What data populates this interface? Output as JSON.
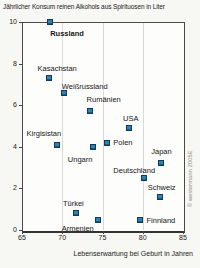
{
  "chart_data": {
    "type": "scatter",
    "title": "Jährlicher Konsum reinen Alkohols aus Spirituosen in Liter",
    "xlabel": "Lebenserwartung bei Geburt in Jahren",
    "ylabel": "",
    "xlim": [
      65,
      85
    ],
    "ylim": [
      0,
      10
    ],
    "x_ticks": [
      65,
      70,
      75,
      80,
      85
    ],
    "y_ticks": [
      0,
      2,
      4,
      6,
      8,
      10
    ],
    "x_gridlines": [
      70,
      75,
      80
    ],
    "grid": "vertical-only",
    "legend": "none",
    "marker": {
      "shape": "square",
      "fill": "#2b84b4",
      "border": "#123a57",
      "size": 6
    },
    "source": "© westermann 2005E",
    "points": [
      {
        "name": "Russland",
        "x": 68.5,
        "y": 10.0,
        "bold": true,
        "label_dx": 0,
        "label_dy": 8
      },
      {
        "name": "Kasachstan",
        "x": 68.3,
        "y": 7.3,
        "bold": false,
        "label_dx": -11,
        "label_dy": -13
      },
      {
        "name": "Weißrussland",
        "x": 70.2,
        "y": 6.6,
        "bold": false,
        "label_dx": -2,
        "label_dy": -10
      },
      {
        "name": "Rumänien",
        "x": 73.4,
        "y": 5.7,
        "bold": false,
        "label_dx": -3,
        "label_dy": -15
      },
      {
        "name": "USA",
        "x": 78.3,
        "y": 4.9,
        "bold": false,
        "label_dx": -6,
        "label_dy": -13
      },
      {
        "name": "Polen",
        "x": 75.6,
        "y": 4.2,
        "bold": false,
        "label_dx": 6,
        "label_dy": -4
      },
      {
        "name": "Kirgisistan",
        "x": 69.3,
        "y": 4.1,
        "bold": false,
        "label_dx": -30,
        "label_dy": -15
      },
      {
        "name": "Ungarn",
        "x": 73.8,
        "y": 4.0,
        "bold": false,
        "label_dx": -25,
        "label_dy": 9
      },
      {
        "name": "Japan",
        "x": 82.3,
        "y": 3.2,
        "bold": false,
        "label_dx": -10,
        "label_dy": -15
      },
      {
        "name": "Deutschland",
        "x": 80.2,
        "y": 2.5,
        "bold": false,
        "label_dx": -31,
        "label_dy": -11
      },
      {
        "name": "Schweiz",
        "x": 82.1,
        "y": 1.6,
        "bold": false,
        "label_dx": -12,
        "label_dy": -13
      },
      {
        "name": "Türkei",
        "x": 71.7,
        "y": 0.8,
        "bold": false,
        "label_dx": -13,
        "label_dy": -13
      },
      {
        "name": "Finnland",
        "x": 79.6,
        "y": 0.5,
        "bold": false,
        "label_dx": 7,
        "label_dy": -3
      },
      {
        "name": "Armenien",
        "x": 74.4,
        "y": 0.5,
        "bold": false,
        "label_dx": -36,
        "label_dy": 5
      }
    ]
  }
}
